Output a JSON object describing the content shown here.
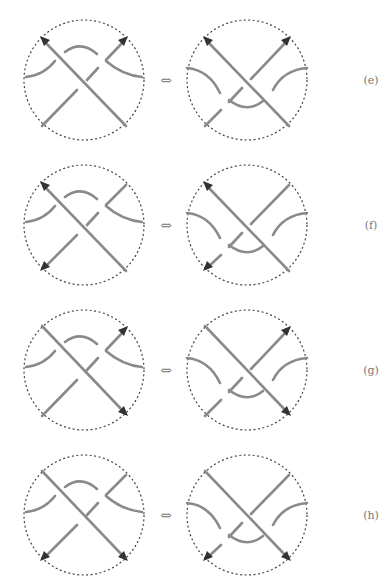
{
  "figure": {
    "equivalence_symbol": "⇔",
    "rows": [
      {
        "label": "(e)",
        "left": {
          "over": "nw",
          "arc": "top",
          "arrows": [
            "nw-end-nw",
            "ne-end-ne"
          ]
        },
        "right": {
          "over": "nw",
          "arc": "bottom",
          "arrows": [
            "nw-end-nw",
            "ne-end-ne"
          ]
        }
      },
      {
        "label": "(f)",
        "left": {
          "over": "nw",
          "arc": "top",
          "arrows": [
            "nw-end-nw",
            "ne-end-sw"
          ]
        },
        "right": {
          "over": "nw",
          "arc": "bottom",
          "arrows": [
            "nw-end-nw",
            "ne-end-sw"
          ]
        }
      },
      {
        "label": "(g)",
        "left": {
          "over": "nw",
          "arc": "top",
          "arrows": [
            "nw-end-se",
            "ne-end-ne"
          ]
        },
        "right": {
          "over": "nw",
          "arc": "bottom",
          "arrows": [
            "nw-end-se",
            "ne-end-ne"
          ]
        }
      },
      {
        "label": "(h)",
        "left": {
          "over": "nw",
          "arc": "top",
          "arrows": [
            "nw-end-se",
            "ne-end-sw"
          ]
        },
        "right": {
          "over": "nw",
          "arc": "bottom",
          "arrows": [
            "nw-end-se",
            "ne-end-sw"
          ]
        }
      }
    ],
    "colors": {
      "strand": "#8a8a8a",
      "arrowhead": "#333333",
      "boundary": "#444444",
      "label": "#777777"
    }
  }
}
